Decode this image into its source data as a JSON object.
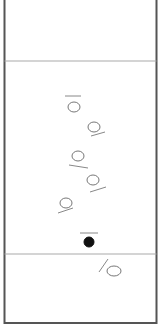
{
  "diagram": {
    "type": "sheet-play-diagram",
    "colors": {
      "border": "#555555",
      "divider": "#aaaaaa",
      "open_piece": "#777777",
      "filled_piece": "#111111",
      "direction_line": "#888888"
    },
    "frame": {
      "left": 4.5,
      "right": 156.5,
      "top": 0,
      "bottom": 323
    },
    "dividers": [
      {
        "y": 61
      },
      {
        "y": 254
      }
    ],
    "pieces": [
      {
        "id": "piece-1",
        "cx": 74,
        "cy": 107,
        "rx": 6,
        "ry": 5,
        "filled": false,
        "line": {
          "x1": 65,
          "y1": 96,
          "x2": 81,
          "y2": 96
        }
      },
      {
        "id": "piece-2",
        "cx": 94,
        "cy": 127,
        "rx": 6,
        "ry": 5,
        "filled": false,
        "line": {
          "x1": 91,
          "y1": 136,
          "x2": 105,
          "y2": 132
        }
      },
      {
        "id": "piece-3",
        "cx": 78,
        "cy": 156,
        "rx": 6,
        "ry": 5,
        "filled": false,
        "line": {
          "x1": 69,
          "y1": 165,
          "x2": 88,
          "y2": 168
        }
      },
      {
        "id": "piece-4",
        "cx": 93,
        "cy": 180,
        "rx": 6,
        "ry": 5,
        "filled": false,
        "line": {
          "x1": 90,
          "y1": 192,
          "x2": 106,
          "y2": 187
        }
      },
      {
        "id": "piece-5",
        "cx": 66,
        "cy": 203,
        "rx": 6,
        "ry": 5,
        "filled": false,
        "line": {
          "x1": 58,
          "y1": 213,
          "x2": 73,
          "y2": 208
        }
      },
      {
        "id": "piece-6",
        "cx": 89,
        "cy": 242,
        "rx": 5,
        "ry": 5,
        "filled": true,
        "line": {
          "x1": 80,
          "y1": 233,
          "x2": 98,
          "y2": 233
        }
      },
      {
        "id": "piece-7",
        "cx": 114,
        "cy": 271,
        "rx": 7,
        "ry": 5,
        "filled": false,
        "line": {
          "x1": 99,
          "y1": 272,
          "x2": 108,
          "y2": 259
        }
      }
    ]
  }
}
